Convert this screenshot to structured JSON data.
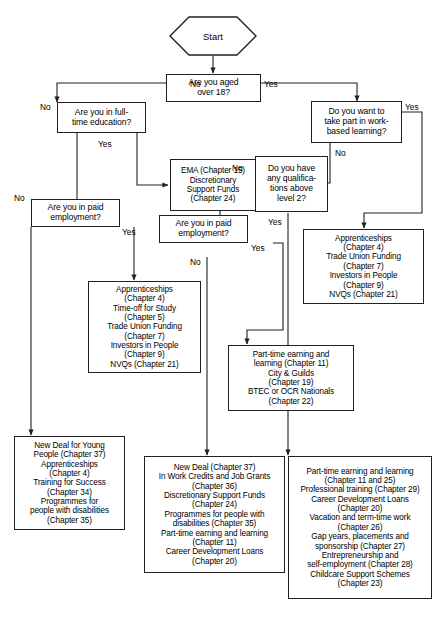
{
  "diagram": {
    "title": "Start",
    "nodes": {
      "start": {
        "label": "Start"
      },
      "q_age": {
        "label": "Are you aged\nover 18?"
      },
      "q_fulltime": {
        "label": "Are you in full-\ntime education?"
      },
      "q_wbl": {
        "label": "Do you want to\ntake part in work-\nbased learning?"
      },
      "q_quals": {
        "label": "Do you have\nany qualifica-\ntions above\nlevel 2?"
      },
      "q_paid_left": {
        "label": "Are you in paid\nemployment?"
      },
      "q_paid_mid": {
        "label": "Are you in paid\nemployment?"
      },
      "o_ema": {
        "label": "EMA (Chapter 15)\nDiscretionary\nSupport Funds\n(Chapter 24)"
      },
      "o_appr_right": {
        "label": "Apprenticeships\n(Chapter 4)\nTrade Union Funding\n(Chapter 7)\nInvestors in People\n(Chapter 9)\nNVQs (Chapter 21)"
      },
      "o_appr_mid": {
        "label": "Apprenticeships\n(Chapter 4)\nTime-off for Study\n(Chapter 5)\nTrade Union Funding\n(Chapter 7)\nInvestors in People\n(Chapter 9)\nNVQs (Chapter 21)"
      },
      "o_parttime_mid": {
        "label": "Part-time earning and\nlearning (Chapter 11)\nCity & Guilds\n(Chapter 19)\nBTEC or OCR Nationals\n(Chapter 22)"
      },
      "o_newdeal_young": {
        "label": "New Deal for Young\nPeople (Chapter 37)\nApprenticeships\n(Chapter 4)\nTraining for Success\n(Chapter 34)\nProgrammes for\npeople with disabilities\n(Chapter 35)"
      },
      "o_newdeal": {
        "label": "New Deal (Chapter 37)\nIn Work Credits and Job Grants\n(Chapter 36)\nDiscretionary Support Funds\n(Chapter 24)\nProgrammes for people with\ndisabilities (Chapter 35)\nPart-time earning and learning\n(Chapter 11)\nCareer Development Loans\n(Chapter 20)"
      },
      "o_parttime_right": {
        "label": "Part-time earning and learning\n(Chapter 11 and 25)\nProfessional training (Chapter 29)\nCareer Development Loans\n(Chapter 20)\nVacation and term-time work\n(Chapter 26)\nGap years, placements and\nsponsorship (Chapter 27)\nEntrepreneurship and\nself-employment (Chapter 28)\nChildcare Support Schemes\n(Chapter 23)"
      }
    },
    "edge_labels": {
      "age_no": "No",
      "age_yes": "Yes",
      "fulltime_no": "No",
      "fulltime_yes": "Yes",
      "wbl_yes": "Yes",
      "wbl_no": "No",
      "quals_no": "No",
      "quals_yes": "Yes",
      "paid_left_no": "No",
      "paid_left_yes": "Yes",
      "paid_mid_no": "No",
      "paid_mid_yes": "Yes"
    },
    "colors": {
      "stroke": "#231f20",
      "background": "#ffffff",
      "text": "#000000"
    }
  }
}
